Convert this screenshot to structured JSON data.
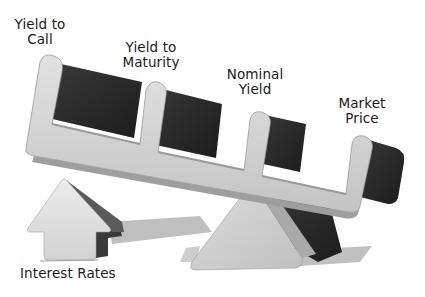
{
  "diagram": {
    "concept": "Seesaw: rising interest rates vs bond yield measures and market price",
    "seesaw_labels": [
      {
        "id": "yield_to_call",
        "text": "Yield to\nCall"
      },
      {
        "id": "yield_to_maturity",
        "text": "Yield to\nMaturity"
      },
      {
        "id": "nominal_yield",
        "text": "Nominal\nYield"
      },
      {
        "id": "market_price",
        "text": "Market\nPrice"
      }
    ],
    "lever_label": "Interest Rates",
    "colors": {
      "beam_light": "#d6d6d6",
      "beam_mid": "#bdbdbd",
      "block_dark": "#2b2b2b",
      "block_darker": "#1a1a1a",
      "shadow": "#a8a8a8",
      "text": "#1a1a1a"
    }
  }
}
